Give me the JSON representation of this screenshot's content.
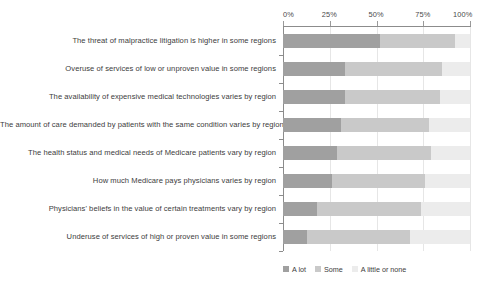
{
  "chart_data": {
    "type": "bar",
    "subtype": "stacked-horizontal-100",
    "title": "",
    "xlabel": "",
    "ylabel": "",
    "xlim": [
      0,
      100
    ],
    "grid": true,
    "legend_position": "bottom-right",
    "xticks": [
      "0%",
      "25%",
      "50%",
      "75%",
      "100%"
    ],
    "xtick_values": [
      0,
      25,
      50,
      75,
      100
    ],
    "categories": [
      "The threat of malpractice litigation is higher in some regions",
      "Overuse of services of low or unproven value in some regions",
      "The availability of expensive medical technologies varies by region",
      "The amount of care demanded by patients with the same condition varies by region",
      "The health status and medical needs of Medicare patients vary by region",
      "How much Medicare pays physicians varies by region",
      "Physicians' beliefs in the value of certain treatments vary by region",
      "Underuse of services of high or proven value in some regions"
    ],
    "series": [
      {
        "name": "A lot",
        "color": "#a0a0a0",
        "values": [
          52,
          33,
          33,
          31,
          29,
          26,
          18,
          13
        ]
      },
      {
        "name": "Some",
        "color": "#c9c9c9",
        "values": [
          40,
          52,
          51,
          47,
          50,
          50,
          56,
          55
        ]
      },
      {
        "name": "A little or none",
        "color": "#ececec",
        "values": [
          8,
          15,
          16,
          22,
          21,
          24,
          26,
          32
        ]
      }
    ]
  },
  "legend": {
    "items": [
      {
        "label": "A lot",
        "color": "#a0a0a0"
      },
      {
        "label": "Some",
        "color": "#c9c9c9"
      },
      {
        "label": "A little or none",
        "color": "#ececec"
      }
    ]
  }
}
